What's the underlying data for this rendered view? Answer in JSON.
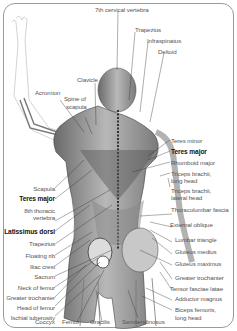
{
  "diagram": {
    "labels_top": [
      {
        "text": "7th cervical vertebra",
        "bold": false
      },
      {
        "text": "Trapezius",
        "bold": false
      },
      {
        "text": "Infraspinatus",
        "bold": false
      },
      {
        "text": "Deltoid",
        "bold": false
      },
      {
        "text": "Clavicle",
        "bold": false
      },
      {
        "text": "Acromion",
        "bold": false
      },
      {
        "text": "Spine of",
        "bold": false
      },
      {
        "text": "scapula",
        "bold": false
      }
    ],
    "labels_left": [
      {
        "text": "Scapula",
        "bold": false
      },
      {
        "text": "Teres major",
        "bold": true
      },
      {
        "text": "8th thoracic",
        "bold": false
      },
      {
        "text": "vertebra",
        "bold": false
      },
      {
        "text": "Latissimus dorsi",
        "bold": true
      },
      {
        "text": "Trapezius",
        "bold": false
      },
      {
        "text": "Floating rib",
        "bold": false
      },
      {
        "text": "Iliac crest",
        "bold": false
      },
      {
        "text": "Sacrum",
        "bold": false
      },
      {
        "text": "Neck of femur",
        "bold": false
      },
      {
        "text": "Greater trochanter",
        "bold": false
      },
      {
        "text": "Head of femur",
        "bold": false
      },
      {
        "text": "Ischial tuberosity",
        "bold": false
      }
    ],
    "labels_right": [
      {
        "text": "Teres minor",
        "bold": false
      },
      {
        "text": "Teres major",
        "bold": true
      },
      {
        "text": "Rhomboid major",
        "bold": false
      },
      {
        "text": "Triceps brachii,",
        "bold": false
      },
      {
        "text": "long head",
        "bold": false
      },
      {
        "text": "Triceps brachii,",
        "bold": false
      },
      {
        "text": "lateral head",
        "bold": false
      },
      {
        "text": "Thoracolumbar fascia",
        "bold": false
      },
      {
        "text": "External oblique",
        "bold": false
      },
      {
        "text": "Lumbar triangle",
        "bold": false
      },
      {
        "text": "Gluteus medius",
        "bold": false
      },
      {
        "text": "Gluteus maximus",
        "bold": false
      },
      {
        "text": "Greater trochanter",
        "bold": false
      },
      {
        "text": "Tensor fasciae latae",
        "bold": false
      },
      {
        "text": "Adductor magnus",
        "bold": false
      },
      {
        "text": "Biceps femoris,",
        "bold": false
      },
      {
        "text": "long head",
        "bold": false
      }
    ],
    "labels_bottom": [
      {
        "text": "Coccyx",
        "bold": false
      },
      {
        "text": "Femur",
        "bold": false
      },
      {
        "text": "Gracilis",
        "bold": false
      },
      {
        "text": "Semitendinosus",
        "bold": false
      }
    ]
  }
}
